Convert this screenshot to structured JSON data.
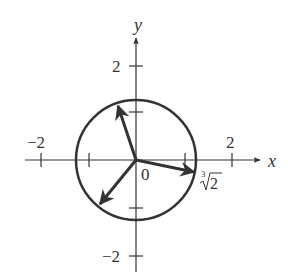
{
  "diagram": {
    "type": "complex-plane-roots",
    "axes": {
      "x_label": "x",
      "y_label": "y",
      "x_ticks": [
        {
          "value": -2,
          "label": "−2"
        },
        {
          "value": -1,
          "label": ""
        },
        {
          "value": 1,
          "label": ""
        },
        {
          "value": 2,
          "label": "2"
        }
      ],
      "y_ticks": [
        {
          "value": 2,
          "label": "2"
        },
        {
          "value": 1,
          "label": ""
        },
        {
          "value": -1,
          "label": ""
        },
        {
          "value": -2,
          "label": "−2"
        }
      ],
      "origin_label": "0"
    },
    "circle": {
      "radius_label": "∛2",
      "radius_value": 1.26
    },
    "vectors": [
      {
        "name": "root-1",
        "angle_deg": -10
      },
      {
        "name": "root-2",
        "angle_deg": 110
      },
      {
        "name": "root-3",
        "angle_deg": 230
      }
    ],
    "labels": {
      "x_axis": "x",
      "y_axis": "y",
      "origin": "0",
      "x_neg2": "−2",
      "x_pos2": "2",
      "y_pos2": "2",
      "y_neg2": "−2",
      "cbrt_index": "3",
      "cbrt_radicand": "2"
    },
    "colors": {
      "stroke": "#333333",
      "background": "#ffffff"
    }
  }
}
